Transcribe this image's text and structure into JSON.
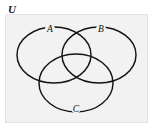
{
  "figure": {
    "background_color": "#ffffff",
    "universe_fill": "#f2f2f2",
    "stroke_color": "#141414",
    "width": 153,
    "height": 136
  },
  "universe": {
    "label": "U",
    "rect": {
      "x": 5.5,
      "y": 14.5,
      "width": 142,
      "height": 108
    }
  },
  "sets": [
    {
      "key": "A",
      "label": "A",
      "cx": 54,
      "cy": 55,
      "rx": 37,
      "ry": 28,
      "label_x": 50,
      "label_y": 32
    },
    {
      "key": "B",
      "label": "B",
      "cx": 99,
      "cy": 55,
      "rx": 37,
      "ry": 28,
      "label_x": 101,
      "label_y": 32
    },
    {
      "key": "C",
      "label": "C",
      "cx": 76,
      "cy": 83,
      "rx": 37,
      "ry": 29,
      "label_x": 76,
      "label_y": 112
    }
  ]
}
